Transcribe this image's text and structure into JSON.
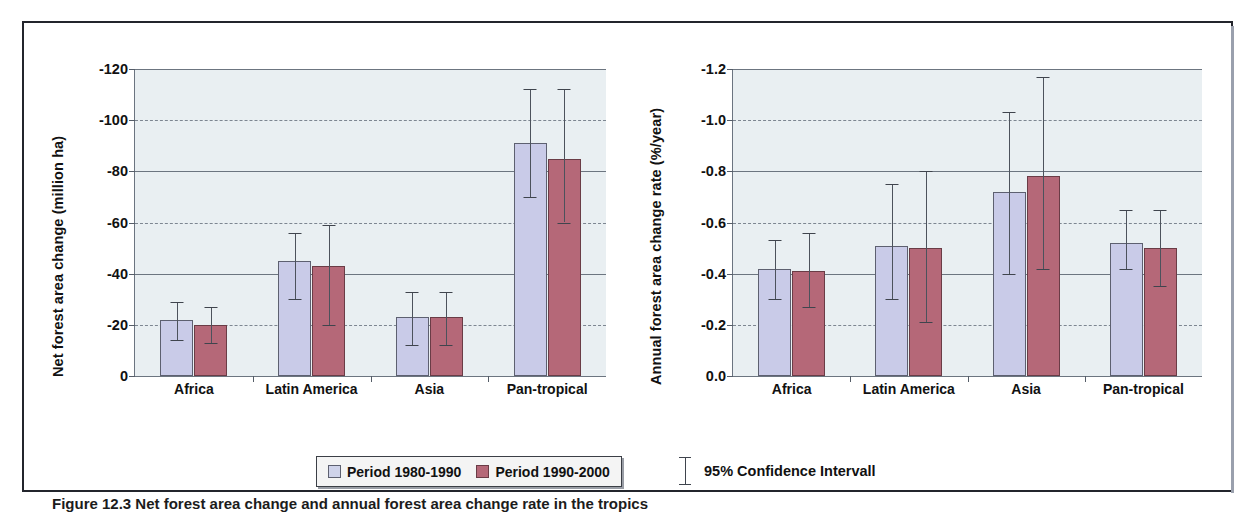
{
  "figure": {
    "caption": "Figure 12.3  Net forest area change and annual forest area change rate in the tropics",
    "legend": {
      "series": [
        {
          "label": "Period 1980-1990",
          "color": "#cfd3ea"
        },
        {
          "label": "Period 1990-2000",
          "color": "#b56878"
        }
      ],
      "error_note": "95% Confidence Intervall"
    }
  },
  "chart_data": [
    {
      "type": "bar",
      "title": "",
      "xlabel": "",
      "ylabel": "Net forest area change (million ha)",
      "categories": [
        "Africa",
        "Latin America",
        "Asia",
        "Pan-tropical"
      ],
      "yticks": [
        "-120",
        "-100",
        "-80",
        "-60",
        "-40",
        "-20",
        "0"
      ],
      "ytick_values": [
        120,
        100,
        80,
        60,
        40,
        20,
        0
      ],
      "ylim": [
        0,
        120
      ],
      "grid": true,
      "legend_position": "bottom",
      "series": [
        {
          "name": "Period 1980-1990",
          "color": "#cfd3ea",
          "values": [
            22,
            45,
            23,
            91
          ],
          "ci_low": [
            14,
            30,
            12,
            70
          ],
          "ci_high": [
            29,
            56,
            33,
            112
          ]
        },
        {
          "name": "Period 1990-2000",
          "color": "#b56878",
          "values": [
            20,
            43,
            23,
            85
          ],
          "ci_low": [
            13,
            20,
            12,
            60
          ],
          "ci_high": [
            27,
            59,
            33,
            112
          ]
        }
      ]
    },
    {
      "type": "bar",
      "title": "",
      "xlabel": "",
      "ylabel": "Annual forest area change rate (%/year)",
      "categories": [
        "Africa",
        "Latin America",
        "Asia",
        "Pan-tropical"
      ],
      "yticks": [
        "-1.2",
        "-1.0",
        "-0.8",
        "-0.6",
        "-0.4",
        "-0.2",
        "0.0"
      ],
      "ytick_values": [
        1.2,
        1.0,
        0.8,
        0.6,
        0.4,
        0.2,
        0.0
      ],
      "ylim": [
        0,
        1.2
      ],
      "grid": true,
      "legend_position": "bottom",
      "series": [
        {
          "name": "Period 1980-1990",
          "color": "#cfd3ea",
          "values": [
            0.42,
            0.51,
            0.72,
            0.52
          ],
          "ci_low": [
            0.3,
            0.3,
            0.4,
            0.42
          ],
          "ci_high": [
            0.53,
            0.75,
            1.03,
            0.65
          ]
        },
        {
          "name": "Period 1990-2000",
          "color": "#b56878",
          "values": [
            0.41,
            0.5,
            0.78,
            0.5
          ],
          "ci_low": [
            0.27,
            0.21,
            0.42,
            0.35
          ],
          "ci_high": [
            0.56,
            0.8,
            1.17,
            0.65
          ]
        }
      ]
    }
  ]
}
